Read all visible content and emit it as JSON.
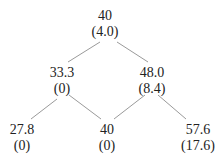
{
  "tree": {
    "type": "binomial-tree",
    "nodes": [
      {
        "id": "root",
        "price": "40",
        "value": "(4.0)",
        "x": 105,
        "y": 8
      },
      {
        "id": "down",
        "price": "33.3",
        "value": "(0)",
        "x": 62,
        "y": 65
      },
      {
        "id": "up",
        "price": "48.0",
        "value": "(8.4)",
        "x": 150,
        "y": 65
      },
      {
        "id": "down-down",
        "price": "27.8",
        "value": "(0)",
        "x": 20,
        "y": 122
      },
      {
        "id": "up-down",
        "price": "40",
        "value": "(0)",
        "x": 107,
        "y": 122
      },
      {
        "id": "up-up",
        "price": "57.6",
        "value": "(17.6)",
        "x": 198,
        "y": 122
      }
    ],
    "edges": [
      {
        "from": "root",
        "to": "down"
      },
      {
        "from": "root",
        "to": "up"
      },
      {
        "from": "down",
        "to": "down-down"
      },
      {
        "from": "down",
        "to": "up-down"
      },
      {
        "from": "up",
        "to": "up-down"
      },
      {
        "from": "up",
        "to": "up-up"
      }
    ],
    "line_color": "#999999"
  }
}
